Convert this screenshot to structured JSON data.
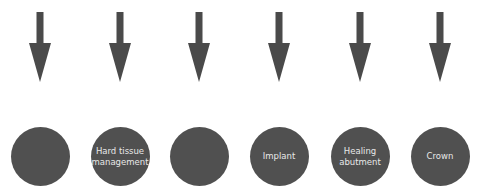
{
  "diagram": {
    "type": "process-steps",
    "colors": {
      "arrow": "#4a4a4a",
      "circle": "#505050",
      "label": "#e8e8e8",
      "background": "#ffffff"
    },
    "steps": [
      {
        "label": "",
        "center_x": 40
      },
      {
        "label": "Hard tissue management",
        "center_x": 120
      },
      {
        "label": "",
        "center_x": 199
      },
      {
        "label": "Implant",
        "center_x": 279
      },
      {
        "label": "Healing abutment",
        "center_x": 360
      },
      {
        "label": "Crown",
        "center_x": 440
      }
    ]
  }
}
